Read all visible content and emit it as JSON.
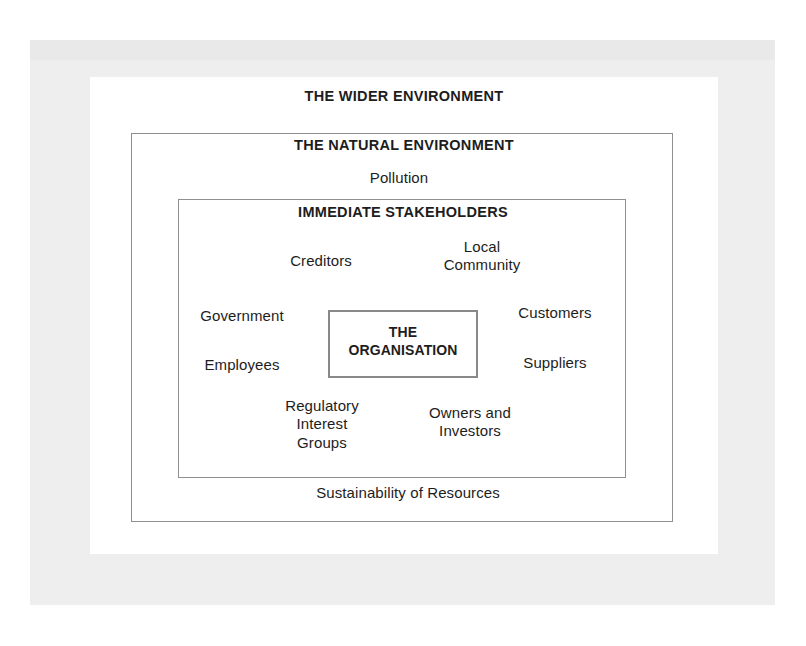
{
  "diagram": {
    "title": "THE WIDER ENVIRONMENT",
    "rings": {
      "wider_environment": "THE WIDER ENVIRONMENT",
      "natural_environment": "THE NATURAL ENVIRONMENT",
      "immediate_stakeholders": "IMMEDIATE STAKEHOLDERS",
      "core": "THE\nORGANISATION"
    },
    "natural_environment_items": [
      "Pollution",
      "Sustainability of Resources"
    ],
    "stakeholders": [
      "Creditors",
      "Local\nCommunity",
      "Government",
      "Customers",
      "Employees",
      "Suppliers",
      "Regulatory\nInterest\nGroups",
      "Owners and\nInvestors"
    ],
    "colors": {
      "page_background": "#ffffff",
      "scan_border": "#eeeeee",
      "box_border": "#8d8f91",
      "core_box_border": "#88898b",
      "text": "#1d1d1d"
    }
  }
}
